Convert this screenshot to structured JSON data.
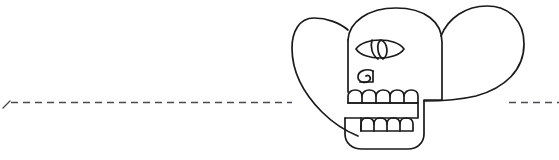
{
  "canvas": {
    "width": 559,
    "height": 160,
    "background_color": "#ffffff"
  },
  "figure": {
    "kind": "line-art-pictograph",
    "stroke_color": "#1a1a1a",
    "fill_color": "none",
    "stroke_width": 1.6,
    "bounding_box": {
      "x": 292,
      "y": 6,
      "width": 232,
      "height": 146
    },
    "parts": [
      {
        "name": "left-lobe",
        "description": "large rounded teardrop ear on the left"
      },
      {
        "name": "right-lobe",
        "description": "large rounded teardrop ear on the right"
      },
      {
        "name": "cranium",
        "description": "domed skull vault"
      },
      {
        "name": "eye",
        "description": "almond lens eye with pupil and lid lines"
      },
      {
        "name": "nose",
        "description": "small spiral comma nose"
      },
      {
        "name": "upper-teeth",
        "description": "row of six arched upper teeth"
      },
      {
        "name": "lower-teeth",
        "description": "row of five arched lower teeth"
      },
      {
        "name": "jaw",
        "description": "rounded lower jaw block"
      }
    ]
  },
  "baseline": {
    "name": "dashed-guideline",
    "y": 103,
    "stroke_color": "#4a4a55",
    "stroke_width": 1.4,
    "dash_pattern": "7 5",
    "left_segment": {
      "x1": 4,
      "x2": 292
    },
    "right_segment": {
      "x1": 508,
      "x2": 559
    },
    "left_tick": {
      "description": "short angled tick at the far left end"
    }
  },
  "clipped_header": {
    "name": "cropped-text-fragment",
    "text": "•   •   •",
    "color": "#8e8e93",
    "note": "bottom pixels of clipped text at top edge"
  }
}
